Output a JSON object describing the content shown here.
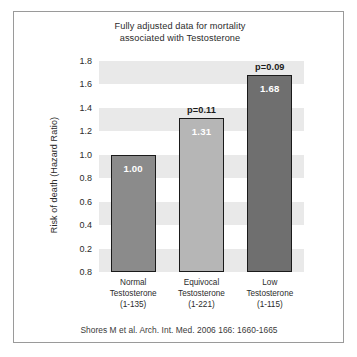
{
  "chart_data": {
    "type": "bar",
    "title": "Fully adjusted data for mortality associated with Testosterone",
    "title_lines": [
      "Fully adjusted data for mortality",
      "associated with Testosterone"
    ],
    "xlabel": "",
    "ylabel": "Risk of death (Hazard Ratio)",
    "ylim": [
      0.0,
      1.8
    ],
    "grid": "horizontal-bands",
    "legend": "none",
    "categories": [
      "Normal Testosterone (1-135)",
      "Equivocal Testosterone (1-221)",
      "Low Testosterone (1-115)"
    ],
    "values": [
      1.0,
      1.31,
      1.68
    ],
    "value_labels": [
      "1.00",
      "1.31",
      "1.68"
    ],
    "annotations": [
      "",
      "p=0.11",
      "p=0.09"
    ],
    "bar_colors": [
      "#8b8b8b",
      "#b6b6b6",
      "#6f6f6f"
    ],
    "bar_border_color": "#1a1a1a",
    "band_color": "#e9e9e9",
    "ytick_labels": [
      "1.8",
      "1.6",
      "1.4",
      "1.2",
      "1.0",
      "0.8",
      "0.6",
      "0.4",
      "0.2",
      "0.8"
    ],
    "ytick_positions": [
      1.8,
      1.6,
      1.4,
      1.2,
      1.0,
      0.8,
      0.6,
      0.4,
      0.2,
      0.0
    ],
    "category_labels": [
      {
        "line1": "Normal",
        "line2": "Testosterone",
        "line3": "(1-135)"
      },
      {
        "line1": "Equivocal",
        "line2": "Testosterone",
        "line3": "(1-221)"
      },
      {
        "line1": "Low",
        "line2": "Testosterone",
        "line3": "(1-115)"
      }
    ],
    "source": "Shores M et al. Arch. Int. Med. 2006 166: 1660-1665"
  }
}
